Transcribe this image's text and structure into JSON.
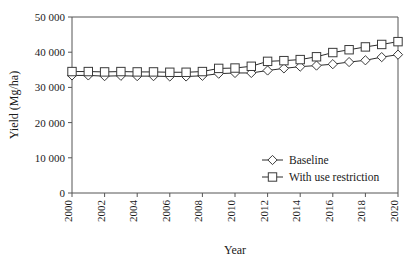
{
  "chart_data": {
    "type": "line",
    "title": "",
    "xlabel": "Year",
    "ylabel": "Yield (Mg/ha)",
    "xlim": [
      2000,
      2020
    ],
    "ylim": [
      0,
      50000
    ],
    "grid": false,
    "legend_position": "inside-lower-right",
    "x": [
      2000,
      2001,
      2002,
      2003,
      2004,
      2005,
      2006,
      2007,
      2008,
      2009,
      2010,
      2011,
      2012,
      2013,
      2014,
      2015,
      2016,
      2017,
      2018,
      2019,
      2020
    ],
    "ytick_labels": [
      "0",
      "10 000",
      "20 000",
      "30 000",
      "40 000",
      "50 000"
    ],
    "ytick_values": [
      0,
      10000,
      20000,
      30000,
      40000,
      50000
    ],
    "xtick_labels": [
      "2000",
      "2002",
      "2004",
      "2006",
      "2008",
      "2010",
      "2012",
      "2014",
      "2016",
      "2018",
      "2020"
    ],
    "xtick_values": [
      2000,
      2002,
      2004,
      2006,
      2008,
      2010,
      2012,
      2014,
      2016,
      2018,
      2020
    ],
    "series": [
      {
        "name": "Baseline",
        "marker": "diamond",
        "values": [
          33400,
          33400,
          33200,
          33300,
          33200,
          33200,
          33100,
          33100,
          33300,
          33900,
          34100,
          34100,
          34800,
          35400,
          35900,
          36200,
          36600,
          37200,
          37700,
          38600,
          39300
        ]
      },
      {
        "name": "With use restriction",
        "marker": "square",
        "values": [
          34500,
          34500,
          34400,
          34500,
          34400,
          34400,
          34300,
          34300,
          34500,
          35400,
          35500,
          36000,
          37400,
          37600,
          37900,
          38700,
          39900,
          40700,
          41500,
          42200,
          43000
        ]
      }
    ]
  },
  "legend": {
    "items": [
      {
        "label": "Baseline",
        "marker": "diamond"
      },
      {
        "label": "With use restriction",
        "marker": "square"
      }
    ]
  }
}
